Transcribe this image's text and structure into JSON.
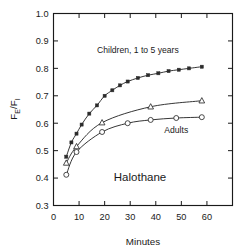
{
  "chart_data": {
    "type": "line",
    "title": "",
    "annotation_main": "Halothane",
    "xlabel": "Minutes",
    "ylabel": "FE/FI",
    "ylabel_parts": {
      "base1": "F",
      "sub1": "E",
      "slash": "/",
      "base2": "F",
      "sub2": "I"
    },
    "xlim": [
      0,
      70
    ],
    "ylim": [
      0.3,
      1.0
    ],
    "xticks": [
      0,
      10,
      20,
      30,
      40,
      50,
      60,
      70
    ],
    "xticklabels": [
      "0",
      "10",
      "20",
      "30",
      "40",
      "50",
      "60",
      ""
    ],
    "yticks": [
      0.3,
      0.4,
      0.5,
      0.6,
      0.7,
      0.8,
      0.9,
      1.0
    ],
    "yticklabels": [
      "0.3",
      "0.4",
      "0.5",
      "0.6",
      "0.7",
      "0.8",
      "0.9",
      "1.0"
    ],
    "grid": false,
    "legend": "in-plot annotations",
    "series": [
      {
        "name": "Children, 1 to 5 years",
        "marker": "filled-square",
        "label_text": "Children, 1 to 5 years",
        "label_x": 33,
        "label_y": 0.855,
        "x": [
          5,
          7,
          9,
          11,
          14,
          17,
          20,
          23,
          26,
          29,
          33,
          37,
          41,
          45,
          49,
          53,
          58
        ],
        "y": [
          0.478,
          0.53,
          0.562,
          0.595,
          0.635,
          0.665,
          0.7,
          0.72,
          0.738,
          0.752,
          0.765,
          0.775,
          0.782,
          0.79,
          0.795,
          0.8,
          0.806
        ]
      },
      {
        "name": "Children, older",
        "marker": "open-triangle",
        "label_text": "",
        "x": [
          5,
          9,
          19,
          38,
          58
        ],
        "y": [
          0.455,
          0.515,
          0.602,
          0.66,
          0.682
        ]
      },
      {
        "name": "Adults",
        "marker": "open-circle",
        "label_text": "Adults",
        "label_x": 48,
        "label_y": 0.565,
        "x": [
          5,
          9,
          19,
          29,
          38,
          48,
          58
        ],
        "y": [
          0.412,
          0.495,
          0.568,
          0.6,
          0.612,
          0.619,
          0.622
        ]
      }
    ]
  }
}
